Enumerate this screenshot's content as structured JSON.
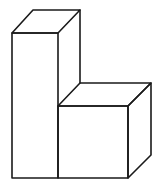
{
  "diagram": {
    "type": "isometric-block-figure",
    "colors": {
      "background": "#ffffff",
      "stroke": "#1a1a1a"
    },
    "shapes": [
      {
        "name": "tall-prism",
        "front_face": [
          [
            12,
            33
          ],
          [
            58,
            33
          ],
          [
            58,
            178
          ],
          [
            12,
            178
          ]
        ],
        "top_face": [
          [
            12,
            33
          ],
          [
            33,
            10
          ],
          [
            80,
            10
          ],
          [
            58,
            33
          ]
        ],
        "side_face": [
          [
            58,
            33
          ],
          [
            80,
            10
          ],
          [
            80,
            83
          ],
          [
            58,
            106
          ]
        ]
      },
      {
        "name": "cube",
        "front_face": [
          [
            58,
            106
          ],
          [
            128,
            106
          ],
          [
            128,
            178
          ],
          [
            58,
            178
          ]
        ],
        "top_face": [
          [
            58,
            106
          ],
          [
            80,
            83
          ],
          [
            151,
            83
          ],
          [
            128,
            106
          ]
        ],
        "side_face": [
          [
            128,
            106
          ],
          [
            151,
            83
          ],
          [
            151,
            155
          ],
          [
            128,
            178
          ]
        ]
      }
    ]
  }
}
